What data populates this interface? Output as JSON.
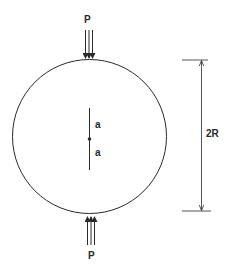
{
  "figure": {
    "type": "disk-under-diametral-compression-with-central-crack",
    "stroke_color": "#2a2a2a",
    "background": "#ffffff",
    "disk": {
      "cx": 89.5,
      "cy": 136.5,
      "r": 77
    },
    "crack": {
      "x": 89.5,
      "y_top": 108,
      "y_bottom": 170,
      "center_y": 139
    },
    "labels": {
      "top_load": "P",
      "bottom_load": "P",
      "crack_upper_half": "a",
      "crack_lower_half": "a",
      "diameter": "2R"
    }
  }
}
